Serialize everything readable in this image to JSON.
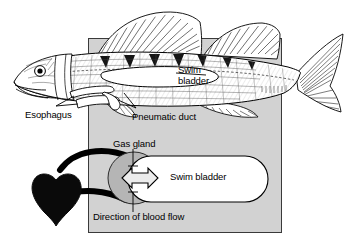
{
  "figure": {
    "background_color": "#ffffff",
    "panel_color": "#d2d2d2",
    "ink_color": "#000000"
  },
  "panel": {
    "name": "gray-background-panel",
    "x": 88,
    "y": 38,
    "width": 194,
    "height": 195,
    "fill": "#d2d2d2",
    "stroke": "#000000"
  },
  "upper_diagram": {
    "name": "fish-lateral-view",
    "description": "Line drawing of a perch-like fish in lateral view with swim bladder, esophagus and pneumatic duct shown",
    "labels": [
      {
        "id": "swim-bladder-fish",
        "text": "Swim bladder",
        "line1": "Swim",
        "line2": "bladder",
        "x": 178,
        "y": 70
      },
      {
        "id": "esophagus",
        "text": "Esophagus",
        "x": 25,
        "y": 110
      },
      {
        "id": "pneumatic-duct",
        "text": "Pneumatic duct",
        "x": 132,
        "y": 112
      }
    ]
  },
  "lower_diagram": {
    "name": "swim-bladder-schematic",
    "description": "Schematic of gas gland, rete mirabile and swim bladder with blood flow arrows",
    "labels": [
      {
        "id": "gas-gland",
        "text": "Gas gland",
        "x": 115,
        "y": 140
      },
      {
        "id": "swim-bladder-schematic",
        "text": "Swim bladder",
        "x": 172,
        "y": 173
      },
      {
        "id": "direction-of-blood-flow",
        "text": "Direction of blood flow",
        "x": 94,
        "y": 213
      }
    ],
    "parts": [
      {
        "id": "rete-mirabile",
        "name": "rete-mirabile-shape",
        "fill": "#000000"
      },
      {
        "id": "blood-vessel",
        "name": "blood-vessel-path",
        "fill": "#000000"
      },
      {
        "id": "gas-gland-circle",
        "name": "gas-gland-circle",
        "fill": "#b4b4b4"
      },
      {
        "id": "swim-bladder-capsule",
        "name": "swim-bladder-capsule",
        "fill": "#ffffff"
      },
      {
        "id": "gas-exchange-arrow",
        "name": "double-headed-arrow",
        "fill": "#e8e8e8"
      }
    ]
  }
}
